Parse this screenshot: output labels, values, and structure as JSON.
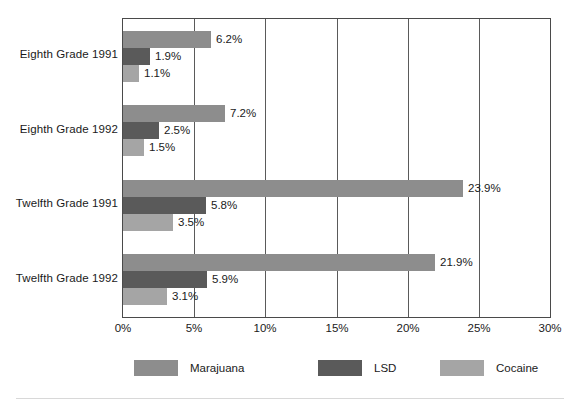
{
  "chart_data": {
    "type": "bar",
    "orientation": "horizontal",
    "title": "",
    "subtitle": "",
    "xlabel": "",
    "ylabel": "",
    "xlim": [
      0,
      30
    ],
    "xtick_labels": [
      "0%",
      "5%",
      "10%",
      "15%",
      "20%",
      "25%",
      "30%"
    ],
    "xtick_values": [
      0,
      5,
      10,
      15,
      20,
      25,
      30
    ],
    "grid": true,
    "legend_position": "bottom",
    "categories": [
      "Eighth Grade 1991",
      "Eighth Grade 1992",
      "Twelfth Grade 1991",
      "Twelfth Grade 1992"
    ],
    "series": [
      {
        "name": "Marajuana",
        "color": "#8d8d8d",
        "values": [
          6.2,
          7.2,
          23.9,
          21.9
        ],
        "labels": [
          "6.2%",
          "7.2%",
          "23.9%",
          "21.9%"
        ]
      },
      {
        "name": "LSD",
        "color": "#5a5a5a",
        "values": [
          1.9,
          2.5,
          5.8,
          5.9
        ],
        "labels": [
          "1.9%",
          "2.5%",
          "5.8%",
          "5.9%"
        ]
      },
      {
        "name": "Cocaine",
        "color": "#a5a5a5",
        "values": [
          1.1,
          1.5,
          3.5,
          3.1
        ],
        "labels": [
          "1.1%",
          "1.5%",
          "3.5%",
          "3.1%"
        ]
      }
    ]
  },
  "legend": {
    "items": [
      {
        "label": "Marajuana",
        "color": "#8d8d8d"
      },
      {
        "label": "LSD",
        "color": "#5a5a5a"
      },
      {
        "label": "Cocaine",
        "color": "#a5a5a5"
      }
    ]
  },
  "axis": {
    "frame_color": "#4a4a4a",
    "grid_color": "#5a5a5a"
  }
}
